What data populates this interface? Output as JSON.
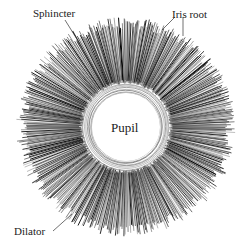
{
  "diagram": {
    "labels": {
      "sphincter": "Sphincter",
      "iris_root": "Iris root",
      "pupil": "Pupil",
      "dilator": "Dilator"
    },
    "geometry": {
      "center": [
        126,
        127
      ],
      "pupil_radius": 34,
      "sphincter_outer_radius": 46,
      "iris_outer_radius": 108
    },
    "colors": {
      "background": "#ffffff",
      "stroke": "#1a1a1a",
      "text": "#222222"
    }
  }
}
